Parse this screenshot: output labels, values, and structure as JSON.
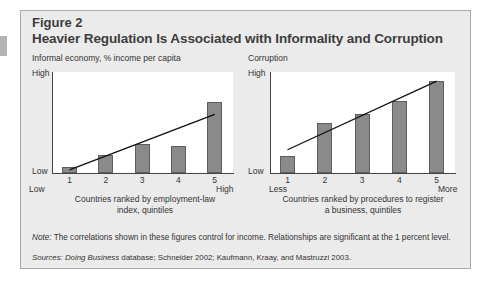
{
  "figure": {
    "label": "Figure 2",
    "title": "Heavier Regulation Is Associated with Informality and Corruption",
    "note_label": "Note:",
    "note_text": " The correlations shown in these figures control for income.  Relationships are significant at the 1 percent level.",
    "sources_label": "Sources:",
    "sources_italic": "Doing Business",
    "sources_text": " database; Schneider 2002; Kaufmann, Kraay, and Mastruzzi 2003.",
    "colors": {
      "bar": "#8a8a8a",
      "bar_border": "#5e5e5e",
      "panel_bg": "#ebebeb",
      "plot_bg": "#ffffff",
      "trend": "#111111"
    }
  },
  "chart_data": [
    {
      "type": "bar",
      "title": "Informal economy, % income per capita",
      "categories": [
        "1",
        "2",
        "3",
        "4",
        "5"
      ],
      "values": [
        6,
        18,
        29,
        27,
        70
      ],
      "trendline": {
        "start": 3,
        "end": 58
      },
      "ylabel": "Informal economy, % income per capita",
      "y_tick_labels": [
        "Low",
        "High"
      ],
      "x_end_labels": [
        "Low",
        "High"
      ],
      "xlabel": "Countries ranked by employment-law index, quintiles",
      "xlabel_lines": [
        "Countries ranked by employment-law",
        "index, quintiles"
      ],
      "ylim": [
        0,
        100
      ],
      "grid": false,
      "legend": null
    },
    {
      "type": "bar",
      "title": "Corruption",
      "categories": [
        "1",
        "2",
        "3",
        "4",
        "5"
      ],
      "values": [
        17,
        50,
        58,
        71,
        91
      ],
      "trendline": {
        "start": 23,
        "end": 91
      },
      "ylabel": "Corruption",
      "y_tick_labels": [
        "Low",
        "High"
      ],
      "x_end_labels": [
        "Less",
        "More"
      ],
      "xlabel": "Countries ranked by procedures to register a business, quintiles",
      "xlabel_lines": [
        "Countries ranked by procedures to register",
        "a business, quintiles"
      ],
      "ylim": [
        0,
        100
      ],
      "grid": false,
      "legend": null
    }
  ]
}
